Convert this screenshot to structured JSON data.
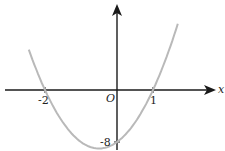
{
  "chart_data": {
    "type": "line",
    "title": "",
    "function": "y = 4x^2 + 4x - 8",
    "xlabel": "x",
    "ylabel": "y",
    "origin_label": "O",
    "x_intercepts": [
      -2,
      1
    ],
    "y_intercept": -8,
    "vertex": [
      -0.5,
      -9
    ],
    "tick_labels": {
      "x": [
        "-2",
        "1"
      ],
      "y": [
        "-8"
      ]
    },
    "x": [
      -2.45,
      -2.0,
      -1.5,
      -1.0,
      -0.5,
      0.0,
      0.5,
      1.0,
      1.5,
      1.69
    ],
    "values": [
      6.2,
      0.0,
      -5.0,
      -8.0,
      -9.0,
      -8.0,
      -5.0,
      0.0,
      7.0,
      10.2
    ],
    "xlim": [
      -3.1,
      2.7
    ],
    "ylim": [
      -9.2,
      13
    ],
    "grid": false,
    "curve_color": "#b9b9b9",
    "axis_color": "#1a1a1a"
  }
}
